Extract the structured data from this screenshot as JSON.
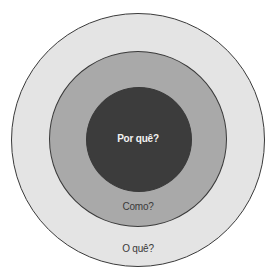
{
  "diagram": {
    "type": "concentric-circles",
    "rings": [
      {
        "id": "outer",
        "label": "O quê?",
        "color": "#e4e4e4"
      },
      {
        "id": "middle",
        "label": "Como?",
        "color": "#a9a9a9"
      },
      {
        "id": "inner",
        "label": "Por quê?",
        "color": "#3c3c3c"
      }
    ],
    "stroke_color": "#3a3a3a"
  }
}
